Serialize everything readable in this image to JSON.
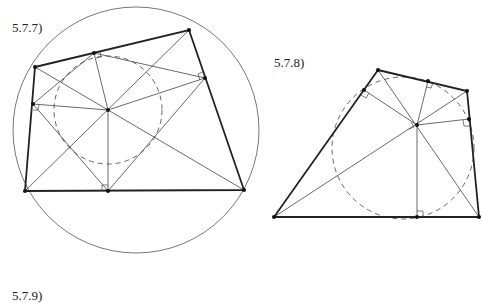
{
  "figures": [
    {
      "label": "5.7.7)",
      "label_pos": [
        12,
        21
      ],
      "vertices": [
        [
          35,
          67
        ],
        [
          189,
          30
        ],
        [
          244,
          190
        ],
        [
          25,
          191
        ]
      ],
      "center": [
        108,
        110
      ],
      "feet": [
        [
          94,
          53
        ],
        [
          205,
          78
        ],
        [
          108,
          191
        ],
        [
          33,
          104
        ]
      ],
      "circumcircle": {
        "cx": 136,
        "cy": 130,
        "r": 123
      },
      "incircle_dashed": {
        "cx": 108,
        "cy": 110,
        "r": 54
      }
    },
    {
      "label": "5.7.8)",
      "label_pos": [
        274,
        56
      ],
      "vertices": [
        [
          378,
          70
        ],
        [
          467,
          91
        ],
        [
          479,
          217
        ],
        [
          274,
          217
        ]
      ],
      "center": [
        417,
        125
      ],
      "feet": [
        [
          428,
          81
        ],
        [
          469,
          119
        ],
        [
          417,
          217
        ],
        [
          364,
          90
        ]
      ],
      "circle_dashed": {
        "cx": 403,
        "cy": 148,
        "r": 71
      }
    },
    {
      "label": "5.7.9)",
      "label_pos": [
        12,
        289
      ]
    }
  ]
}
